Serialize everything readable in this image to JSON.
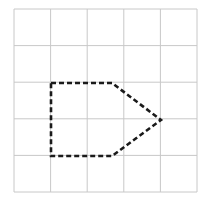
{
  "diagram": {
    "type": "grid-with-polygon",
    "grid": {
      "rows": 5,
      "cols": 5,
      "line_color": "#c8c8c8",
      "origin": [
        14,
        9
      ],
      "cell_size": 36.6
    },
    "shape": {
      "name": "dashed pentagon",
      "stroke_color": "#1a1a1a",
      "dash": "5 3",
      "vertices": [
        [
          51,
          83
        ],
        [
          112,
          83
        ],
        [
          161,
          120
        ],
        [
          112,
          156
        ],
        [
          51,
          156
        ]
      ]
    }
  }
}
